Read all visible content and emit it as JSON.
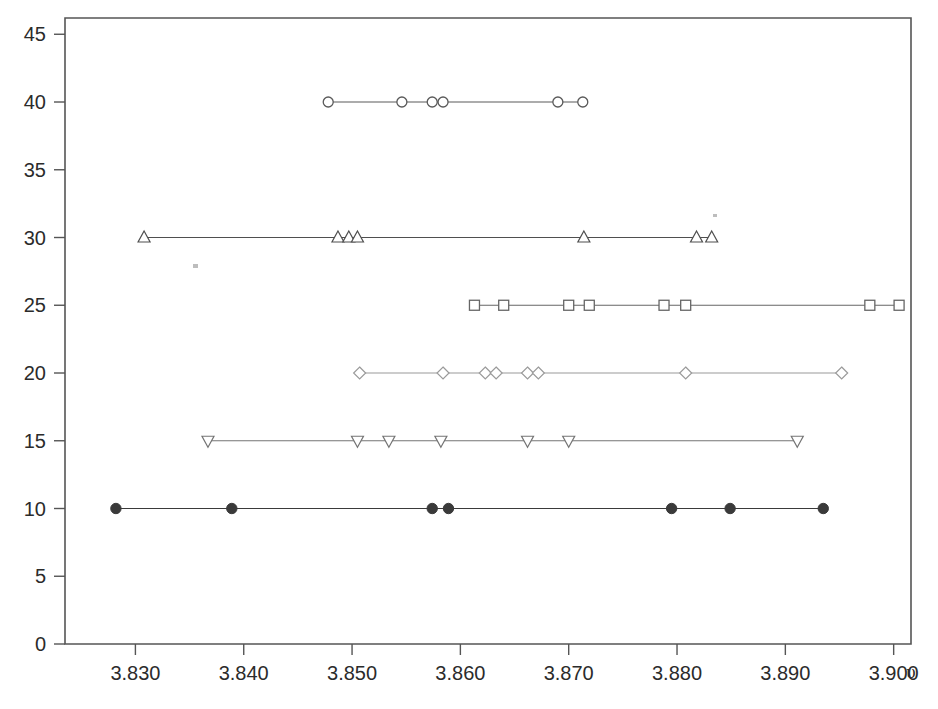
{
  "chart_data": {
    "type": "scatter",
    "title": "",
    "subtitle": "",
    "xlabel": "υ",
    "ylabel": "",
    "xlim": [
      3.8235,
      3.9016
    ],
    "ylim": [
      0,
      46.2
    ],
    "xticks": [
      "3.830",
      "3.840",
      "3.850",
      "3.860",
      "3.870",
      "3.880",
      "3.890",
      "3.900"
    ],
    "xtick_values": [
      3.83,
      3.84,
      3.85,
      3.86,
      3.87,
      3.88,
      3.89,
      3.9
    ],
    "yticks": [
      "0",
      "5",
      "10",
      "15",
      "20",
      "25",
      "30",
      "35",
      "40",
      "45"
    ],
    "ytick_values": [
      0,
      5,
      10,
      15,
      20,
      25,
      30,
      35,
      40,
      45
    ],
    "grid": false,
    "legend": "none",
    "series": [
      {
        "name": "row-40",
        "level": 40,
        "marker": "open-circle",
        "color": "#5a5a5a",
        "x": [
          3.8478,
          3.8546,
          3.8574,
          3.8584,
          3.869,
          3.8713
        ],
        "y": [
          40,
          40,
          40,
          40,
          40,
          40
        ]
      },
      {
        "name": "row-30",
        "level": 30,
        "marker": "triangle-up",
        "color": "#4f4f4f",
        "x": [
          3.8308,
          3.8487,
          3.8497,
          3.8505,
          3.8714,
          3.8818,
          3.8832
        ],
        "y": [
          30,
          30,
          30,
          30,
          30,
          30,
          30
        ]
      },
      {
        "name": "row-25",
        "level": 25,
        "marker": "open-square",
        "color": "#666666",
        "x": [
          3.8613,
          3.864,
          3.87,
          3.8719,
          3.8788,
          3.8808,
          3.8978,
          3.9005
        ],
        "y": [
          25,
          25,
          25,
          25,
          25,
          25,
          25,
          25
        ]
      },
      {
        "name": "row-20",
        "level": 20,
        "marker": "open-diamond",
        "color": "#9a9a9a",
        "x": [
          3.8507,
          3.8584,
          3.8623,
          3.8633,
          3.8662,
          3.8672,
          3.8808,
          3.8952
        ],
        "y": [
          20,
          20,
          20,
          20,
          20,
          20,
          20,
          20
        ]
      },
      {
        "name": "row-15",
        "level": 15,
        "marker": "triangle-down",
        "color": "#747474",
        "x": [
          3.8367,
          3.8505,
          3.8534,
          3.8582,
          3.8662,
          3.87,
          3.8911
        ],
        "y": [
          15,
          15,
          15,
          15,
          15,
          15,
          15
        ]
      },
      {
        "name": "row-10",
        "level": 10,
        "marker": "filled-circle",
        "color": "#3a3a3a",
        "x": [
          3.8282,
          3.8389,
          3.8574,
          3.8589,
          3.8795,
          3.8849,
          3.8935
        ],
        "y": [
          10,
          10,
          10,
          10,
          10,
          10,
          10
        ]
      }
    ]
  }
}
